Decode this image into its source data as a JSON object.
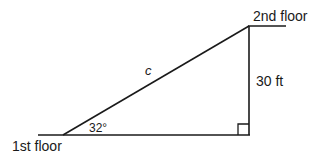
{
  "diagram": {
    "type": "right-triangle",
    "labels": {
      "bottom_floor": "1st floor",
      "top_floor": "2nd floor",
      "hypotenuse": "c",
      "vertical_side": "30 ft",
      "angle": "32°"
    },
    "colors": {
      "stroke": "#1a1a1a",
      "background": "#ffffff"
    }
  }
}
